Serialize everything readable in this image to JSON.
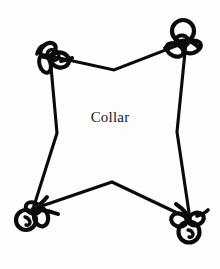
{
  "figure": {
    "kind": "sewing-pattern-piece-diagram",
    "label": "Collar",
    "background_color": "#fdfdfc",
    "ink_color": "#0a0a0a",
    "canvas": {
      "width": 220,
      "height": 269
    }
  },
  "shape": {
    "name": "collar-outline",
    "description": "four-pointed concave quadrilateral (star-like) pattern piece",
    "stroke_color": "#0a0a0a",
    "stroke_width": 3.1,
    "fill": "none",
    "vertices": [
      {
        "name": "top-left-point",
        "x": 50,
        "y": 56
      },
      {
        "name": "top-center-notch",
        "x": 114,
        "y": 70
      },
      {
        "name": "top-right-point",
        "x": 186,
        "y": 42
      },
      {
        "name": "right-waist-notch",
        "x": 177,
        "y": 132
      },
      {
        "name": "bottom-right-point",
        "x": 190,
        "y": 219
      },
      {
        "name": "bottom-center-notch",
        "x": 112,
        "y": 182
      },
      {
        "name": "bottom-left-point",
        "x": 33,
        "y": 209
      },
      {
        "name": "left-waist-notch",
        "x": 57,
        "y": 133
      }
    ]
  },
  "corner_marks": [
    {
      "name": "knot-top-left",
      "cx": 54,
      "cy": 56,
      "style": "scribbled-bow-knot",
      "has_ring": false
    },
    {
      "name": "knot-top-right",
      "cx": 184,
      "cy": 44,
      "style": "scribbled-bow-knot",
      "has_ring": true
    },
    {
      "name": "knot-bottom-left",
      "cx": 32,
      "cy": 212,
      "style": "scribbled-bow-knot",
      "has_ring": true
    },
    {
      "name": "knot-bottom-right",
      "cx": 188,
      "cy": 222,
      "style": "scribbled-bow-knot",
      "has_ring": true
    }
  ],
  "center_text": {
    "value": "Collar",
    "x": 113,
    "y": 119,
    "font_size_px": 15,
    "color": "#1a1a1a"
  }
}
